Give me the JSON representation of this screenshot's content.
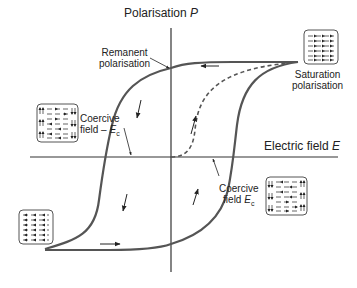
{
  "diagram": {
    "axes": {
      "y_label": "Polarisation",
      "y_symbol": "P",
      "x_label": "Electric field",
      "x_symbol": "E"
    },
    "annotations": {
      "remanent": [
        "Remanent",
        "polarisation"
      ],
      "saturation": [
        "Saturation",
        "polarisation"
      ],
      "coercive_neg": {
        "line1": "Coercive",
        "line2": "field –",
        "symbol": "E",
        "sub": "c"
      },
      "coercive_pos": {
        "line1": "Coercive",
        "line2": "field",
        "symbol": "E",
        "sub": "c"
      }
    },
    "domain_boxes": [
      {
        "id": "saturation-positive",
        "description": "all dipoles aligned right"
      },
      {
        "id": "mixed-negative-coercive",
        "description": "mixed domains up/down with horizontal arrows"
      },
      {
        "id": "saturation-negative",
        "description": "all dipoles aligned left"
      },
      {
        "id": "mixed-positive-coercive",
        "description": "mixed domains down/up with horizontal arrows"
      }
    ],
    "colors": {
      "curve": "#555555",
      "axis": "#333333",
      "dashed": "#555555",
      "box_border": "#555555"
    }
  }
}
